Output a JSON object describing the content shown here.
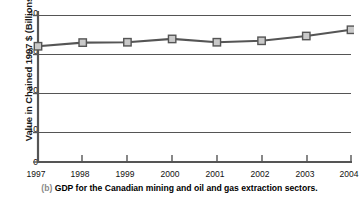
{
  "figure": {
    "caption_index": "(b)",
    "caption_text": "GDP for the Canadian mining and oil and gas extraction sectors."
  },
  "chart_data": {
    "type": "line",
    "title": "",
    "subtitle": "",
    "xlabel": "",
    "ylabel": "Value in Chained 1997 $ (Billions)",
    "categories": [
      "1997",
      "1998",
      "1999",
      "2000",
      "2001",
      "2002",
      "2003",
      "2004"
    ],
    "x": [
      1997,
      1998,
      1999,
      2000,
      2001,
      2002,
      2003,
      2004
    ],
    "values": [
      31.6,
      32.6,
      32.7,
      33.6,
      32.7,
      33.1,
      34.4,
      36.1
    ],
    "series": [
      {
        "name": "GDP",
        "values": [
          31.6,
          32.6,
          32.7,
          33.6,
          32.7,
          33.1,
          34.4,
          36.1
        ]
      }
    ],
    "ylim": [
      0,
      40
    ],
    "yticks": [
      0,
      10,
      20,
      30,
      40
    ],
    "ytick_labels": [
      "0",
      "10",
      "20",
      "30",
      "40"
    ],
    "xlim": [
      1997,
      2004
    ],
    "grid": "horizontal",
    "legend": "none",
    "line_color": "#555555",
    "marker_face_color": "#c9c9c9",
    "marker_edge_color": "#555555",
    "marker_shape": "square",
    "axis_color": "#555555"
  }
}
